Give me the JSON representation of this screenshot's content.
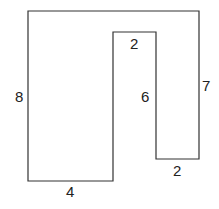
{
  "diagram": {
    "type": "rectilinear-polygon",
    "stroke_color": "#333333",
    "labels": {
      "left_side": "8",
      "bottom_left": "4",
      "inner_top": "2",
      "inner_right_side": "6",
      "right_side": "7",
      "bottom_right": "2"
    }
  }
}
